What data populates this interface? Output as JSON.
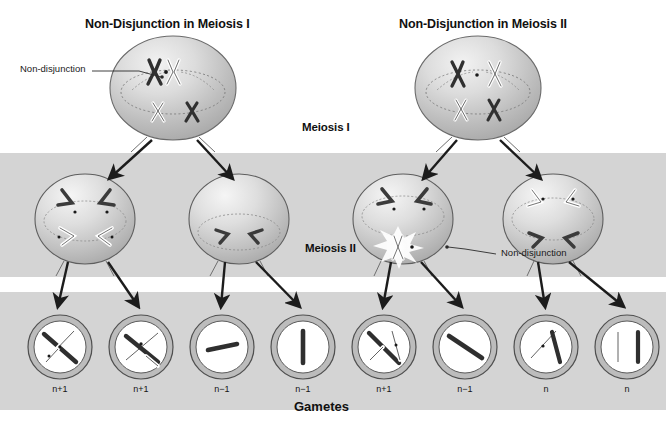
{
  "figure": {
    "background_color": "#ffffff",
    "band_color": "#d2d2d2",
    "chrom_dark_color": "#3a3a3a",
    "chrom_light_color": "#ffffff",
    "cell_fill_color": "#c9c9c9",
    "outline_color": "#4a4a4a"
  },
  "titles": {
    "left": "Non-Disjunction in Meiosis I",
    "right": "Non-Disjunction in Meiosis II"
  },
  "stages": {
    "meiosis_one": "Meiosis I",
    "meiosis_two": "Meiosis II",
    "gametes": "Gametes"
  },
  "callouts": {
    "left": "Non-disjunction",
    "right": "Non-disjunction"
  },
  "parent_cells": [
    {
      "id": "parent-left",
      "cx": 173,
      "cy": 88,
      "rx": 63,
      "ry": 52
    },
    {
      "id": "parent-right",
      "cx": 478,
      "cy": 88,
      "rx": 63,
      "ry": 52
    }
  ],
  "meiosis_one_cells": [
    {
      "id": "m1-cell-1",
      "cx": 85,
      "cy": 219,
      "rx": 50,
      "ry": 45,
      "chromosomes": "four-v-dark-and-light"
    },
    {
      "id": "m1-cell-2",
      "cx": 239,
      "cy": 219,
      "rx": 50,
      "ry": 45,
      "chromosomes": "two-v-dark"
    },
    {
      "id": "m1-cell-3",
      "cx": 403,
      "cy": 219,
      "rx": 50,
      "ry": 45,
      "chromosomes": "two-v-dark-plus-nondisjunction-light"
    },
    {
      "id": "m1-cell-4",
      "cx": 553,
      "cy": 219,
      "rx": 50,
      "ry": 45,
      "chromosomes": "two-v-light-two-v-dark"
    }
  ],
  "gametes": [
    {
      "id": "gamete-1",
      "cx": 60,
      "cy": 347,
      "r": 32,
      "label": "n+1",
      "contents": "dark-and-light-chromatid-pair"
    },
    {
      "id": "gamete-2",
      "cx": 141,
      "cy": 347,
      "r": 32,
      "label": "n+1",
      "contents": "dark-and-light-chromatid-pair"
    },
    {
      "id": "gamete-3",
      "cx": 222,
      "cy": 347,
      "r": 32,
      "label": "n−1",
      "contents": "single-short-dark"
    },
    {
      "id": "gamete-4",
      "cx": 303,
      "cy": 347,
      "r": 32,
      "label": "n−1",
      "contents": "single-vertical-dark"
    },
    {
      "id": "gamete-5",
      "cx": 384,
      "cy": 347,
      "r": 32,
      "label": "n+1",
      "contents": "dark-and-light-pair"
    },
    {
      "id": "gamete-6",
      "cx": 465,
      "cy": 347,
      "r": 32,
      "label": "n−1",
      "contents": "single-diagonal-dark"
    },
    {
      "id": "gamete-7",
      "cx": 546,
      "cy": 347,
      "r": 32,
      "label": "n",
      "contents": "one-light-one-dark"
    },
    {
      "id": "gamete-8",
      "cx": 627,
      "cy": 347,
      "r": 32,
      "label": "n",
      "contents": "one-light-one-dark-vertical"
    }
  ],
  "bands": [
    {
      "id": "band-meiosis-one",
      "y": 153,
      "height": 124
    },
    {
      "id": "band-gametes",
      "y": 292,
      "height": 118
    }
  ],
  "arrows": [
    {
      "id": "arrow-p1-a",
      "x1": 152,
      "y1": 142,
      "x2": 106,
      "y2": 180
    },
    {
      "id": "arrow-p1-b",
      "x1": 196,
      "y1": 142,
      "x2": 228,
      "y2": 180
    },
    {
      "id": "arrow-p2-a",
      "x1": 457,
      "y1": 142,
      "x2": 420,
      "y2": 180
    },
    {
      "id": "arrow-p2-b",
      "x1": 499,
      "y1": 142,
      "x2": 538,
      "y2": 180
    },
    {
      "id": "arrow-c1-a",
      "x1": 66,
      "y1": 262,
      "x2": 56,
      "y2": 308
    },
    {
      "id": "arrow-c1-b",
      "x1": 110,
      "y1": 262,
      "x2": 140,
      "y2": 308
    },
    {
      "id": "arrow-c2-a",
      "x1": 222,
      "y1": 262,
      "x2": 219,
      "y2": 308
    },
    {
      "id": "arrow-c2-b",
      "x1": 258,
      "y1": 262,
      "x2": 300,
      "y2": 308
    },
    {
      "id": "arrow-c3-a",
      "x1": 389,
      "y1": 262,
      "x2": 381,
      "y2": 308
    },
    {
      "id": "arrow-c3-b",
      "x1": 424,
      "y1": 262,
      "x2": 462,
      "y2": 308
    },
    {
      "id": "arrow-c4-a",
      "x1": 536,
      "y1": 262,
      "x2": 544,
      "y2": 308
    },
    {
      "id": "arrow-c4-b",
      "x1": 572,
      "y1": 262,
      "x2": 624,
      "y2": 308
    }
  ]
}
